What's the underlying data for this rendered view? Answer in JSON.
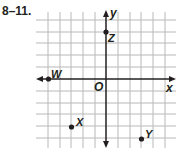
{
  "problem_label": "8–11.",
  "axes": {
    "x_label": "x",
    "y_label": "y",
    "origin_label": "O"
  },
  "grid": {
    "x_range": [
      -5,
      5
    ],
    "y_range": [
      -5,
      5
    ],
    "unit_px": 11.7
  },
  "points": [
    {
      "name": "W",
      "x": -5,
      "y": 0
    },
    {
      "name": "Z",
      "x": 0,
      "y": 4
    },
    {
      "name": "X",
      "x": -3,
      "y": -4
    },
    {
      "name": "Y",
      "x": 3,
      "y": -5
    }
  ],
  "colors": {
    "grid": "#b5b5b5",
    "axis": "#231f20",
    "point": "#231f20"
  }
}
